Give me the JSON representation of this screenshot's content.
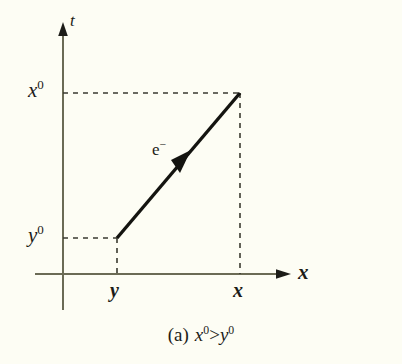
{
  "figure": {
    "caption_tag": "(a)",
    "caption_lhs_base": "x",
    "caption_lhs_sup": "0",
    "caption_relation": ">",
    "caption_rhs_base": "y",
    "caption_rhs_sup": "0",
    "caption_full": "(a) x0 > y0"
  },
  "axes": {
    "vertical_label": "t",
    "horizontal_label": "x",
    "line_color": "#6b6b55",
    "origin_px": {
      "x": 63,
      "y": 274
    }
  },
  "ticks": {
    "vertical": [
      {
        "name": "tick-x0",
        "base": "x",
        "sup": "0",
        "value_px": 93
      },
      {
        "name": "tick-y0",
        "base": "y",
        "sup": "0",
        "value_px": 238
      }
    ],
    "horizontal": [
      {
        "name": "tick-y",
        "label": "y",
        "value_px": 117
      },
      {
        "name": "tick-x",
        "label": "x",
        "value_px": 240
      }
    ]
  },
  "worldline": {
    "particle_base": "e",
    "particle_sup": "−",
    "color": "#141410",
    "start_px": {
      "x": 117,
      "y": 238
    },
    "end_px": {
      "x": 240,
      "y": 93
    },
    "arrow_at_px": {
      "x": 182,
      "y": 161
    }
  },
  "guides": {
    "color": "#3a3a30",
    "dashes": [
      {
        "name": "guide-x0-horizontal",
        "from": {
          "x": 63,
          "y": 93
        },
        "to": {
          "x": 240,
          "y": 93
        }
      },
      {
        "name": "guide-y0-horizontal",
        "from": {
          "x": 63,
          "y": 238
        },
        "to": {
          "x": 117,
          "y": 238
        }
      },
      {
        "name": "guide-x-vertical",
        "from": {
          "x": 240,
          "y": 93
        },
        "to": {
          "x": 240,
          "y": 274
        }
      },
      {
        "name": "guide-y-vertical",
        "from": {
          "x": 117,
          "y": 238
        },
        "to": {
          "x": 117,
          "y": 274
        }
      }
    ]
  },
  "colors": {
    "background": "#fdfdf4",
    "ink": "#1c1c18",
    "axis": "#6b6b55",
    "worldline": "#141410"
  }
}
